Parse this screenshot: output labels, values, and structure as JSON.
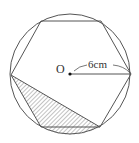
{
  "figure": {
    "center_label": "O",
    "radius_label": "6cm",
    "stroke_color": "#555555",
    "hatch_color": "#666666",
    "background": "#ffffff"
  }
}
